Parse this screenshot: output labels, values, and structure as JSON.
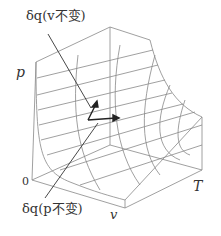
{
  "diagram": {
    "axes": {
      "p": "p",
      "T": "T",
      "v": "v",
      "origin": "0"
    },
    "annotations": [
      {
        "id": "dq_v_const",
        "text": "δq(v不变)"
      },
      {
        "id": "dq_p_const",
        "text": "δq(p不变)"
      }
    ],
    "colors": {
      "line": "#777777",
      "arrow": "#222222",
      "text": "#333333"
    }
  }
}
